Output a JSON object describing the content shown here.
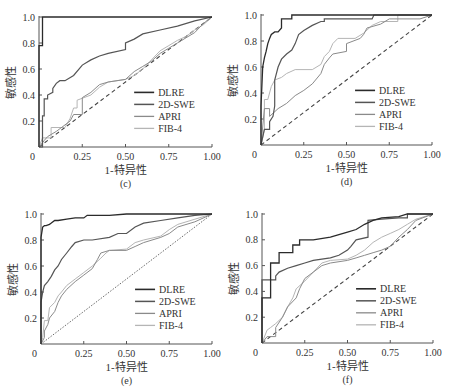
{
  "figure": {
    "ylabel": "敏感性",
    "xlabel": "1-特异性",
    "xticks": [
      "0.25",
      "0.50",
      "0.75",
      "1.00"
    ],
    "yticks": [
      "0.2",
      "0.4",
      "0.6",
      "0.8",
      "1.0"
    ],
    "origin_label": "0",
    "legend": [
      "DLRE",
      "2D-SWE",
      "APRI",
      "FIB-4"
    ]
  },
  "colors": {
    "DLRE": "#2b2b2b",
    "2D-SWE": "#555555",
    "APRI": "#8a8a8a",
    "FIB-4": "#b5b5b5",
    "diagonal": "#444444",
    "axis": "#555555"
  },
  "chart_data": [
    {
      "type": "line",
      "panel": "(c)",
      "title": "",
      "xlabel": "1-特异性",
      "ylabel": "敏感性",
      "xlim": [
        0,
        1
      ],
      "ylim": [
        0,
        1
      ],
      "legend_position": "lower right",
      "diagonal_style": "dashed",
      "series": [
        {
          "name": "DLRE",
          "x": [
            0,
            0,
            0.02,
            0.02,
            1
          ],
          "y": [
            0,
            0.78,
            0.78,
            1,
            1
          ]
        },
        {
          "name": "2D-SWE",
          "x": [
            0,
            0.02,
            0.02,
            0.03,
            0.03,
            0.05,
            0.05,
            0.08,
            0.08,
            0.1,
            0.12,
            0.15,
            0.2,
            0.25,
            0.3,
            0.35,
            0.4,
            0.5,
            0.5,
            0.55,
            0.6,
            0.7,
            0.8,
            0.9,
            1
          ],
          "y": [
            0,
            0,
            0.24,
            0.24,
            0.37,
            0.37,
            0.4,
            0.42,
            0.45,
            0.49,
            0.51,
            0.51,
            0.55,
            0.63,
            0.67,
            0.7,
            0.72,
            0.75,
            0.8,
            0.83,
            0.87,
            0.9,
            0.93,
            0.97,
            1
          ]
        },
        {
          "name": "APRI",
          "x": [
            0,
            0.03,
            0.05,
            0.1,
            0.15,
            0.18,
            0.2,
            0.25,
            0.25,
            0.3,
            0.35,
            0.4,
            0.5,
            0.55,
            0.6,
            0.65,
            0.7,
            0.75,
            0.8,
            0.85,
            0.9,
            0.95,
            1
          ],
          "y": [
            0,
            0.05,
            0.08,
            0.12,
            0.17,
            0.2,
            0.25,
            0.25,
            0.38,
            0.42,
            0.48,
            0.5,
            0.52,
            0.58,
            0.62,
            0.66,
            0.72,
            0.76,
            0.8,
            0.84,
            0.88,
            0.95,
            1
          ]
        },
        {
          "name": "FIB-4",
          "x": [
            0,
            0.02,
            0.07,
            0.07,
            0.15,
            0.18,
            0.2,
            0.22,
            0.22,
            0.3,
            0.35,
            0.4,
            0.5,
            0.55,
            0.6,
            0.65,
            0.7,
            0.75,
            0.8,
            0.85,
            0.9,
            0.95,
            1
          ],
          "y": [
            0,
            0.07,
            0.07,
            0.15,
            0.15,
            0.22,
            0.3,
            0.3,
            0.36,
            0.4,
            0.46,
            0.5,
            0.52,
            0.55,
            0.6,
            0.67,
            0.74,
            0.78,
            0.82,
            0.85,
            0.9,
            0.94,
            1
          ]
        }
      ]
    },
    {
      "type": "line",
      "panel": "(d)",
      "title": "",
      "xlabel": "1-特异性",
      "ylabel": "敏感性",
      "xlim": [
        0,
        1
      ],
      "ylim": [
        0,
        1
      ],
      "legend_position": "lower right",
      "diagonal_style": "dashed",
      "series": [
        {
          "name": "DLRE",
          "x": [
            0,
            0,
            0.01,
            0.02,
            0.03,
            0.04,
            0.05,
            0.06,
            0.08,
            0.1,
            0.12,
            0.12,
            0.18,
            0.18,
            1
          ],
          "y": [
            0,
            0.3,
            0.6,
            0.67,
            0.72,
            0.78,
            0.82,
            0.85,
            0.87,
            0.87,
            0.9,
            0.97,
            0.97,
            1,
            1
          ]
        },
        {
          "name": "2D-SWE",
          "x": [
            0,
            0.02,
            0.05,
            0.05,
            0.07,
            0.08,
            0.08,
            0.1,
            0.12,
            0.15,
            0.18,
            0.2,
            0.22,
            0.25,
            0.3,
            0.35,
            0.37,
            0.37,
            0.65,
            0.66,
            1
          ],
          "y": [
            0,
            0.12,
            0.12,
            0.18,
            0.22,
            0.3,
            0.5,
            0.6,
            0.66,
            0.7,
            0.73,
            0.78,
            0.85,
            0.88,
            0.92,
            0.95,
            0.95,
            0.97,
            0.97,
            1,
            1
          ]
        },
        {
          "name": "APRI",
          "x": [
            0,
            0.02,
            0.05,
            0.05,
            0.1,
            0.15,
            0.2,
            0.25,
            0.3,
            0.35,
            0.37,
            0.4,
            0.42,
            0.5,
            0.5,
            0.58,
            0.6,
            0.62,
            0.7,
            0.75,
            0.8,
            0.93,
            1
          ],
          "y": [
            0,
            0.28,
            0.28,
            0.22,
            0.28,
            0.32,
            0.38,
            0.42,
            0.47,
            0.55,
            0.62,
            0.67,
            0.7,
            0.72,
            0.78,
            0.82,
            0.85,
            0.9,
            0.93,
            0.97,
            0.97,
            0.97,
            1
          ]
        },
        {
          "name": "FIB-4",
          "x": [
            0,
            0.02,
            0.02,
            0.04,
            0.06,
            0.08,
            0.12,
            0.15,
            0.2,
            0.3,
            0.35,
            0.37,
            0.4,
            0.42,
            0.45,
            0.55,
            0.6,
            0.65,
            0.7,
            0.8,
            0.8,
            0.93,
            1
          ],
          "y": [
            0,
            0.12,
            0.35,
            0.35,
            0.45,
            0.5,
            0.52,
            0.55,
            0.58,
            0.58,
            0.62,
            0.68,
            0.72,
            0.78,
            0.82,
            0.82,
            0.86,
            0.92,
            0.95,
            0.95,
            1,
            1,
            1
          ]
        }
      ]
    },
    {
      "type": "line",
      "panel": "(e)",
      "title": "",
      "xlabel": "1-特异性",
      "ylabel": "敏感性",
      "xlim": [
        0,
        1
      ],
      "ylim": [
        0,
        1
      ],
      "legend_position": "lower right",
      "diagonal_style": "dotted",
      "series": [
        {
          "name": "DLRE",
          "x": [
            0,
            0,
            0.01,
            0.02,
            0.03,
            0.05,
            0.06,
            0.08,
            0.1,
            0.15,
            0.2,
            0.25,
            0.27,
            0.4,
            0.5,
            0.6,
            0.95,
            1
          ],
          "y": [
            0,
            0.82,
            0.9,
            0.91,
            0.91,
            0.92,
            0.93,
            0.95,
            0.95,
            0.96,
            0.97,
            0.97,
            0.99,
            0.99,
            1,
            1,
            1,
            1
          ]
        },
        {
          "name": "2D-SWE",
          "x": [
            0,
            0,
            0.01,
            0.02,
            0.04,
            0.06,
            0.08,
            0.1,
            0.12,
            0.15,
            0.18,
            0.2,
            0.25,
            0.3,
            0.4,
            0.45,
            0.5,
            0.55,
            0.6,
            0.7,
            0.8,
            0.9,
            1
          ],
          "y": [
            0,
            0.32,
            0.4,
            0.45,
            0.48,
            0.52,
            0.57,
            0.6,
            0.65,
            0.7,
            0.75,
            0.78,
            0.8,
            0.8,
            0.82,
            0.85,
            0.85,
            0.9,
            0.93,
            0.95,
            0.97,
            0.99,
            1
          ]
        },
        {
          "name": "APRI",
          "x": [
            0,
            0.02,
            0.02,
            0.04,
            0.05,
            0.08,
            0.1,
            0.12,
            0.15,
            0.2,
            0.25,
            0.3,
            0.33,
            0.35,
            0.4,
            0.5,
            0.55,
            0.6,
            0.7,
            0.75,
            0.8,
            0.9,
            1
          ],
          "y": [
            0,
            0.05,
            0.1,
            0.15,
            0.2,
            0.25,
            0.32,
            0.37,
            0.42,
            0.48,
            0.53,
            0.58,
            0.65,
            0.7,
            0.72,
            0.72,
            0.75,
            0.78,
            0.82,
            0.85,
            0.9,
            0.94,
            1
          ]
        },
        {
          "name": "FIB-4",
          "x": [
            0,
            0.01,
            0.02,
            0.04,
            0.05,
            0.08,
            0.1,
            0.12,
            0.15,
            0.2,
            0.25,
            0.3,
            0.35,
            0.38,
            0.4,
            0.5,
            0.55,
            0.6,
            0.7,
            0.75,
            0.8,
            0.9,
            1
          ],
          "y": [
            0,
            0.05,
            0.18,
            0.18,
            0.28,
            0.32,
            0.37,
            0.4,
            0.45,
            0.5,
            0.55,
            0.6,
            0.66,
            0.7,
            0.72,
            0.73,
            0.78,
            0.8,
            0.83,
            0.88,
            0.92,
            0.96,
            1
          ]
        }
      ]
    },
    {
      "type": "line",
      "panel": "(f)",
      "title": "",
      "xlabel": "1-特异性",
      "ylabel": "敏感性",
      "xlim": [
        0,
        1
      ],
      "ylim": [
        0,
        1
      ],
      "legend_position": "lower right",
      "diagonal_style": "dashed",
      "series": [
        {
          "name": "DLRE",
          "x": [
            0,
            0,
            0.05,
            0.05,
            0.1,
            0.1,
            0.18,
            0.18,
            0.22,
            0.22,
            0.3,
            0.4,
            0.45,
            0.5,
            0.55,
            0.6,
            0.65,
            0.7,
            0.8,
            0.85,
            0.9,
            1
          ],
          "y": [
            0,
            0.35,
            0.35,
            0.62,
            0.62,
            0.7,
            0.7,
            0.76,
            0.76,
            0.8,
            0.8,
            0.82,
            0.84,
            0.86,
            0.88,
            0.92,
            0.95,
            0.97,
            0.98,
            1,
            1,
            1
          ]
        },
        {
          "name": "2D-SWE",
          "x": [
            0,
            0,
            0.08,
            0.08,
            0.1,
            0.15,
            0.2,
            0.25,
            0.3,
            0.4,
            0.45,
            0.5,
            0.52,
            0.55,
            0.62,
            0.62,
            0.7,
            0.8,
            0.85,
            0.85,
            1
          ],
          "y": [
            0,
            0.49,
            0.49,
            0.52,
            0.55,
            0.58,
            0.6,
            0.62,
            0.64,
            0.66,
            0.68,
            0.72,
            0.75,
            0.8,
            0.82,
            0.95,
            0.96,
            0.97,
            0.97,
            1,
            1
          ]
        },
        {
          "name": "APRI",
          "x": [
            0,
            0.03,
            0.08,
            0.08,
            0.12,
            0.15,
            0.2,
            0.22,
            0.25,
            0.3,
            0.35,
            0.4,
            0.5,
            0.55,
            0.6,
            0.65,
            0.7,
            0.75,
            0.8,
            0.85,
            0.9,
            1
          ],
          "y": [
            0,
            0.05,
            0.05,
            0.12,
            0.2,
            0.28,
            0.35,
            0.42,
            0.5,
            0.55,
            0.6,
            0.62,
            0.64,
            0.66,
            0.68,
            0.7,
            0.72,
            0.75,
            0.82,
            0.88,
            0.95,
            1
          ]
        },
        {
          "name": "FIB-4",
          "x": [
            0,
            0.03,
            0.05,
            0.08,
            0.12,
            0.15,
            0.18,
            0.2,
            0.25,
            0.3,
            0.35,
            0.4,
            0.5,
            0.55,
            0.6,
            0.65,
            0.7,
            0.75,
            0.8,
            0.85,
            0.9,
            1
          ],
          "y": [
            0,
            0.1,
            0.12,
            0.15,
            0.2,
            0.28,
            0.35,
            0.42,
            0.48,
            0.55,
            0.62,
            0.64,
            0.65,
            0.68,
            0.72,
            0.78,
            0.82,
            0.85,
            0.88,
            0.92,
            0.96,
            1
          ]
        }
      ]
    }
  ]
}
